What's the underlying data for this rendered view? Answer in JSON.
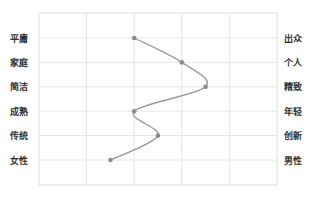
{
  "chart_data": {
    "type": "line",
    "title": "",
    "xlabel": "",
    "ylabel": "",
    "orientation": "horizontal-profile",
    "xlim": [
      0,
      5
    ],
    "grid": true,
    "legend": null,
    "categories_left": [
      "平庸",
      "家庭",
      "简洁",
      "成熟",
      "传统",
      "女性"
    ],
    "categories_right": [
      "出众",
      "个人",
      "精致",
      "年轻",
      "创新",
      "男性"
    ],
    "values": [
      2.0,
      3.0,
      3.5,
      2.0,
      2.5,
      1.5
    ],
    "series": [
      {
        "name": "profile",
        "values": [
          2.0,
          3.0,
          3.5,
          2.0,
          2.5,
          1.5
        ],
        "color": "#999999",
        "smooth": true
      }
    ]
  },
  "colors": {
    "grid": "#e6e6e6",
    "border": "#dddddd",
    "line": "#999999",
    "marker": "#8c8c8c",
    "label": "#333333"
  }
}
